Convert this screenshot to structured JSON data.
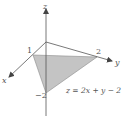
{
  "diagram": {
    "axes": {
      "x_label": "x",
      "y_label": "y",
      "z_label": "z"
    },
    "intercepts": {
      "x": "1",
      "y": "2",
      "z": "−2"
    },
    "equation": "z = 2x + y − 2",
    "colors": {
      "axis": "#555555",
      "plane_fill": "#c4c4c4",
      "plane_edge": "#8a8a8a"
    }
  }
}
